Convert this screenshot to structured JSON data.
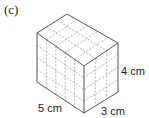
{
  "part_label": "(c)",
  "figure": {
    "type": "cuboid",
    "unit_cubes": true,
    "dimensions": {
      "length": {
        "value": 5,
        "unit": "cm",
        "label": "5 cm"
      },
      "width": {
        "value": 3,
        "unit": "cm",
        "label": "3 cm"
      },
      "height": {
        "value": 4,
        "unit": "cm",
        "label": "4 cm"
      }
    },
    "colors": {
      "edge": "#444444",
      "grid": "#777777"
    }
  }
}
